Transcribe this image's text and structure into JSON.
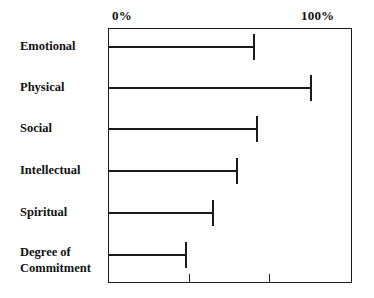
{
  "chart_data": {
    "type": "bar",
    "orientation": "horizontal",
    "title": "",
    "subtitle": "",
    "xlabel": "",
    "ylabel": "",
    "categories": [
      "Emotional",
      "Physical",
      "Social",
      "Intellectual",
      "Spiritual",
      "Degree of Commitment"
    ],
    "values": [
      60,
      83,
      61,
      53,
      43,
      32
    ],
    "xlim": [
      0,
      100
    ],
    "tick_labels": [
      "0%",
      "100%"
    ],
    "tick_values": [
      0,
      100
    ],
    "minor_tick_values": [
      33,
      66
    ],
    "grid": false,
    "legend": null,
    "series": [
      {
        "name": "",
        "values": [
          60,
          83,
          61,
          53,
          43,
          32
        ]
      }
    ],
    "bar_color": "#1a1a1a",
    "frame_color": "#1a1a1a",
    "background_color": "#ffffff"
  },
  "axis": {
    "left_label": "0%",
    "right_label": "100%"
  },
  "rows": [
    {
      "label": "Emotional",
      "label_line_1": "Emotional",
      "label_line_2": "",
      "value": 60
    },
    {
      "label": "Physical",
      "label_line_1": "Physical",
      "label_line_2": "",
      "value": 83
    },
    {
      "label": "Social",
      "label_line_1": "Social",
      "label_line_2": "",
      "value": 61
    },
    {
      "label": "Intellectual",
      "label_line_1": "Intellectual",
      "label_line_2": "",
      "value": 53
    },
    {
      "label": "Spiritual",
      "label_line_1": "Spiritual",
      "label_line_2": "",
      "value": 43
    },
    {
      "label": "Degree of Commitment",
      "label_line_1": "Degree of",
      "label_line_2": "Commitment",
      "value": 32
    }
  ]
}
